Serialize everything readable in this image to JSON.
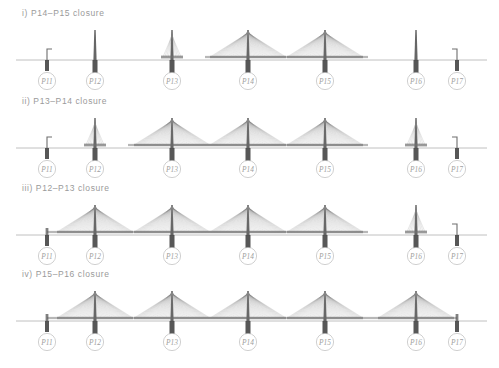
{
  "figure": {
    "type": "bridge-construction-sequence",
    "colors": {
      "ground_line": "#b9b9b9",
      "cable": "#8c8c8c",
      "pylon": "#555555",
      "pier": "#3a3a3a",
      "deck": "#6f6f6f",
      "label_text": "#a0a0a0",
      "label_circle": "#c4c4c4",
      "caption_text": "#9a9a9a"
    }
  },
  "piers": [
    {
      "id": "P11",
      "label": "P11",
      "x": 47
    },
    {
      "id": "P12",
      "label": "P12",
      "x": 95
    },
    {
      "id": "P13",
      "label": "P13",
      "x": 172
    },
    {
      "id": "P14",
      "label": "P14",
      "x": 248
    },
    {
      "id": "P15",
      "label": "P15",
      "x": 325
    },
    {
      "id": "P16",
      "label": "P16",
      "x": 416
    },
    {
      "id": "P17",
      "label": "P17",
      "x": 457
    }
  ],
  "stages": [
    {
      "index": "i)",
      "caption": "i)  P14–P15 closure",
      "top": 8,
      "closure_span": [
        "P14",
        "P15"
      ],
      "elements": [
        {
          "pier": "P11",
          "kind": "abutment-stub",
          "mirrored": false
        },
        {
          "pier": "P12",
          "kind": "bare-pylon"
        },
        {
          "pier": "P13",
          "kind": "starter-fan"
        },
        {
          "pier": "P14",
          "kind": "full-fan"
        },
        {
          "pier": "P15",
          "kind": "full-fan"
        },
        {
          "pier": "P16",
          "kind": "bare-pylon"
        },
        {
          "pier": "P17",
          "kind": "abutment-stub",
          "mirrored": true
        }
      ],
      "deck_segments": [
        {
          "from": 205,
          "to": 368
        }
      ]
    },
    {
      "index": "ii)",
      "caption": "ii)  P13–P14 closure",
      "top": 96,
      "closure_span": [
        "P13",
        "P14"
      ],
      "elements": [
        {
          "pier": "P11",
          "kind": "abutment-stub",
          "mirrored": false
        },
        {
          "pier": "P12",
          "kind": "starter-fan"
        },
        {
          "pier": "P13",
          "kind": "full-fan"
        },
        {
          "pier": "P14",
          "kind": "full-fan"
        },
        {
          "pier": "P15",
          "kind": "full-fan"
        },
        {
          "pier": "P16",
          "kind": "starter-fan"
        },
        {
          "pier": "P17",
          "kind": "abutment-stub",
          "mirrored": true
        }
      ],
      "deck_segments": [
        {
          "from": 128,
          "to": 368
        }
      ]
    },
    {
      "index": "iii)",
      "caption": "iii)  P12–P13 closure",
      "top": 183,
      "closure_span": [
        "P12",
        "P13"
      ],
      "elements": [
        {
          "pier": "P11",
          "kind": "deck-stub"
        },
        {
          "pier": "P12",
          "kind": "full-fan"
        },
        {
          "pier": "P13",
          "kind": "full-fan"
        },
        {
          "pier": "P14",
          "kind": "full-fan"
        },
        {
          "pier": "P15",
          "kind": "full-fan"
        },
        {
          "pier": "P16",
          "kind": "starter-fan"
        },
        {
          "pier": "P17",
          "kind": "abutment-stub",
          "mirrored": true
        }
      ],
      "deck_segments": [
        {
          "from": 47,
          "to": 368
        }
      ]
    },
    {
      "index": "iv)",
      "caption": "iv)  P15–P16 closure",
      "top": 269,
      "closure_span": [
        "P15",
        "P16"
      ],
      "elements": [
        {
          "pier": "P11",
          "kind": "deck-stub"
        },
        {
          "pier": "P12",
          "kind": "full-fan"
        },
        {
          "pier": "P13",
          "kind": "full-fan"
        },
        {
          "pier": "P14",
          "kind": "full-fan"
        },
        {
          "pier": "P15",
          "kind": "full-fan"
        },
        {
          "pier": "P16",
          "kind": "full-fan"
        },
        {
          "pier": "P17",
          "kind": "deck-stub"
        }
      ],
      "deck_segments": [
        {
          "from": 47,
          "to": 457
        }
      ]
    }
  ]
}
